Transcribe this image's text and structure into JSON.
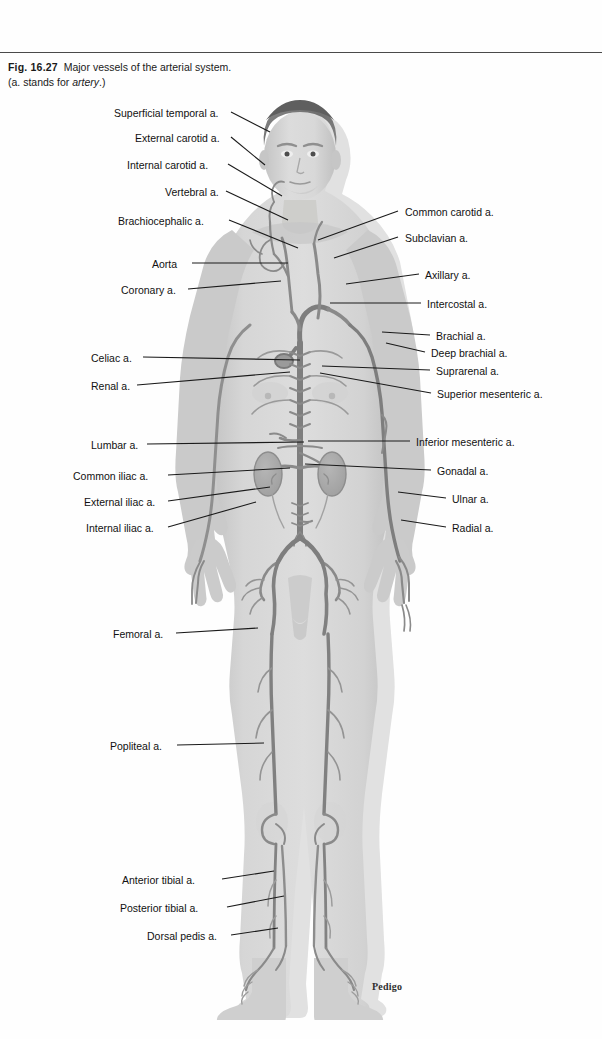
{
  "caption": {
    "figure_number": "Fig. 16.27",
    "title": "Major vessels of the arterial system.",
    "subtitle_prefix": "(a. stands for ",
    "subtitle_italic": "artery",
    "subtitle_suffix": ".)"
  },
  "signature": "Pedigo",
  "colors": {
    "page_background": "#fefefe",
    "rule": "#4a4a4a",
    "label_text": "#111111",
    "leader_line": "#1a1a1a",
    "body_fill": "#cfcfcf",
    "body_fill_light": "#dedede",
    "body_shadow": "#b9b9b9",
    "hair": "#6e6e6e",
    "artery": "#8a8a8a",
    "artery_dark": "#707070",
    "organ": "#a9a9a9"
  },
  "labels_left": [
    {
      "text": "Superficial temporal a.",
      "x": 114,
      "y": 108,
      "line": {
        "x1": 231,
        "y1": 112,
        "x2": 270,
        "y2": 132
      }
    },
    {
      "text": "External carotid a.",
      "x": 135,
      "y": 133,
      "line": {
        "x1": 231,
        "y1": 137,
        "x2": 265,
        "y2": 165
      }
    },
    {
      "text": "Internal carotid a.",
      "x": 127,
      "y": 160,
      "line": {
        "x1": 228,
        "y1": 164,
        "x2": 282,
        "y2": 196
      }
    },
    {
      "text": "Vertebral a.",
      "x": 165,
      "y": 187,
      "line": {
        "x1": 226,
        "y1": 191,
        "x2": 288,
        "y2": 220
      }
    },
    {
      "text": "Brachiocephalic a.",
      "x": 118,
      "y": 216,
      "line": {
        "x1": 229,
        "y1": 220,
        "x2": 298,
        "y2": 248
      }
    },
    {
      "text": "Aorta",
      "x": 152,
      "y": 259,
      "line": {
        "x1": 192,
        "y1": 263,
        "x2": 288,
        "y2": 263
      }
    },
    {
      "text": "Coronary a.",
      "x": 121,
      "y": 285,
      "line": {
        "x1": 188,
        "y1": 289,
        "x2": 281,
        "y2": 281
      }
    },
    {
      "text": "Celiac a.",
      "x": 91,
      "y": 353,
      "line": {
        "x1": 143,
        "y1": 357,
        "x2": 300,
        "y2": 360
      }
    },
    {
      "text": "Renal a.",
      "x": 91,
      "y": 381,
      "line": {
        "x1": 137,
        "y1": 385,
        "x2": 290,
        "y2": 372
      }
    },
    {
      "text": "Lumbar a.",
      "x": 91,
      "y": 440,
      "line": {
        "x1": 147,
        "y1": 444,
        "x2": 304,
        "y2": 442
      }
    },
    {
      "text": "Common iliac a.",
      "x": 73,
      "y": 471,
      "line": {
        "x1": 168,
        "y1": 475,
        "x2": 290,
        "y2": 468
      }
    },
    {
      "text": "External iliac a.",
      "x": 84,
      "y": 497,
      "line": {
        "x1": 168,
        "y1": 501,
        "x2": 270,
        "y2": 487
      }
    },
    {
      "text": "Internal iliac a.",
      "x": 86,
      "y": 523,
      "line": {
        "x1": 168,
        "y1": 527,
        "x2": 256,
        "y2": 502
      }
    },
    {
      "text": "Femoral a.",
      "x": 113,
      "y": 629,
      "line": {
        "x1": 176,
        "y1": 633,
        "x2": 258,
        "y2": 628
      }
    },
    {
      "text": "Popliteal a.",
      "x": 110,
      "y": 741,
      "line": {
        "x1": 177,
        "y1": 745,
        "x2": 264,
        "y2": 743
      }
    },
    {
      "text": "Anterior tibial a.",
      "x": 122,
      "y": 875,
      "line": {
        "x1": 222,
        "y1": 879,
        "x2": 274,
        "y2": 871
      }
    },
    {
      "text": "Posterior tibial a.",
      "x": 120,
      "y": 903,
      "line": {
        "x1": 227,
        "y1": 907,
        "x2": 284,
        "y2": 896
      }
    },
    {
      "text": "Dorsal pedis a.",
      "x": 147,
      "y": 931,
      "line": {
        "x1": 231,
        "y1": 935,
        "x2": 278,
        "y2": 928
      }
    }
  ],
  "labels_right": [
    {
      "text": "Common carotid a.",
      "x": 405,
      "y": 207,
      "line": {
        "x1": 398,
        "y1": 211,
        "x2": 318,
        "y2": 240
      }
    },
    {
      "text": "Subclavian a.",
      "x": 405,
      "y": 233,
      "line": {
        "x1": 398,
        "y1": 237,
        "x2": 334,
        "y2": 258
      }
    },
    {
      "text": "Axillary a.",
      "x": 425,
      "y": 270,
      "line": {
        "x1": 419,
        "y1": 274,
        "x2": 346,
        "y2": 284
      }
    },
    {
      "text": "Intercostal a.",
      "x": 427,
      "y": 299,
      "line": {
        "x1": 421,
        "y1": 303,
        "x2": 330,
        "y2": 303
      }
    },
    {
      "text": "Brachial a.",
      "x": 436,
      "y": 331,
      "line": {
        "x1": 430,
        "y1": 335,
        "x2": 382,
        "y2": 332
      }
    },
    {
      "text": "Deep brachial a.",
      "x": 431,
      "y": 348,
      "line": {
        "x1": 425,
        "y1": 352,
        "x2": 386,
        "y2": 343
      }
    },
    {
      "text": "Suprarenal a.",
      "x": 436,
      "y": 366,
      "line": {
        "x1": 430,
        "y1": 370,
        "x2": 322,
        "y2": 366
      }
    },
    {
      "text": "Superior mesenteric a.",
      "x": 437,
      "y": 389,
      "line": {
        "x1": 431,
        "y1": 393,
        "x2": 320,
        "y2": 373
      }
    },
    {
      "text": "Inferior mesenteric a.",
      "x": 416,
      "y": 437,
      "line": {
        "x1": 410,
        "y1": 441,
        "x2": 308,
        "y2": 441
      }
    },
    {
      "text": "Gonadal a.",
      "x": 437,
      "y": 466,
      "line": {
        "x1": 431,
        "y1": 470,
        "x2": 305,
        "y2": 464
      }
    },
    {
      "text": "Ulnar a.",
      "x": 452,
      "y": 494,
      "line": {
        "x1": 446,
        "y1": 498,
        "x2": 398,
        "y2": 492
      }
    },
    {
      "text": "Radial a.",
      "x": 452,
      "y": 523,
      "line": {
        "x1": 446,
        "y1": 527,
        "x2": 401,
        "y2": 520
      }
    }
  ]
}
